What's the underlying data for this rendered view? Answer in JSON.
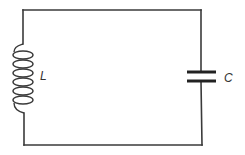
{
  "diagram": {
    "type": "LC circuit",
    "components": [
      {
        "id": "inductor",
        "symbol": "coil",
        "label": "L",
        "position": "left branch"
      },
      {
        "id": "capacitor",
        "symbol": "parallel-plates",
        "label": "C",
        "position": "right branch"
      }
    ],
    "wire_color": "#3a3a3a",
    "background": "#ffffff"
  },
  "labels": {
    "inductor": "L",
    "capacitor": "C"
  }
}
